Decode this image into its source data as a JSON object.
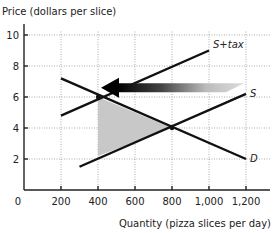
{
  "chart_data": {
    "type": "line",
    "title": "",
    "ylabel": "Price (dollars per slice)",
    "xlabel": "Quantity (pizza slices per day)",
    "xlim": [
      0,
      1250
    ],
    "ylim": [
      0,
      11
    ],
    "x_ticks": [
      200,
      400,
      600,
      800,
      1000,
      1200
    ],
    "x_tick_labels": [
      "200",
      "400",
      "600",
      "800",
      "1,000",
      "1,200"
    ],
    "y_ticks": [
      2,
      4,
      6,
      8,
      10
    ],
    "y_tick_labels": [
      "2",
      "4",
      "6",
      "8",
      "10"
    ],
    "origin_label": "0",
    "grid": true,
    "series": [
      {
        "name": "D",
        "label": "D",
        "points": [
          [
            200,
            7.2
          ],
          [
            1200,
            2.0
          ]
        ]
      },
      {
        "name": "S",
        "label": "S",
        "points": [
          [
            300,
            1.5
          ],
          [
            1200,
            6.2
          ]
        ]
      },
      {
        "name": "S+tax",
        "label": "S+tax",
        "points": [
          [
            200,
            4.8
          ],
          [
            1000,
            9.0
          ]
        ]
      }
    ],
    "shaded_region": {
      "name": "deadweight-loss",
      "points": [
        [
          400,
          6
        ],
        [
          800,
          4
        ],
        [
          400,
          2.2
        ]
      ],
      "color": "#c8c8c8"
    },
    "arrow": {
      "name": "supply-shift-arrow",
      "from": [
        1200,
        6.6
      ],
      "to": [
        400,
        6.6
      ],
      "direction": "left"
    },
    "equilibria": [
      [
        400,
        6
      ],
      [
        800,
        4
      ]
    ]
  }
}
